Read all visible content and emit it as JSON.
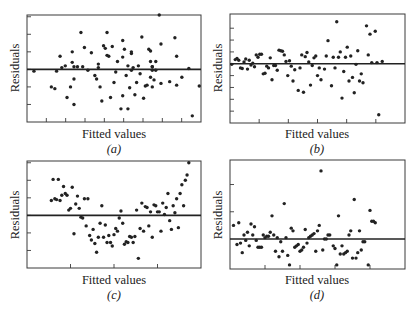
{
  "chart_data": [
    {
      "type": "scatter",
      "panel": "a",
      "caption": "(a)",
      "xlabel": "Fitted values",
      "ylabel": "Residuals",
      "ylim": [
        -3.0,
        3.1
      ],
      "xlim": [
        0,
        1
      ],
      "reference_line": 0,
      "x_ticks": 8,
      "y_ticks": [
        -2,
        -1,
        0,
        1,
        2,
        3
      ],
      "points": [
        [
          0.04,
          -0.1
        ],
        [
          0.14,
          -1.0
        ],
        [
          0.16,
          -1.1
        ],
        [
          0.17,
          -0.1
        ],
        [
          0.19,
          0.75
        ],
        [
          0.2,
          0.1
        ],
        [
          0.22,
          0.2
        ],
        [
          0.23,
          -1.6
        ],
        [
          0.25,
          -1.0
        ],
        [
          0.26,
          1.0
        ],
        [
          0.26,
          0.4
        ],
        [
          0.27,
          -0.55
        ],
        [
          0.27,
          -2.0
        ],
        [
          0.27,
          0.15
        ],
        [
          0.29,
          0.15
        ],
        [
          0.31,
          2.1
        ],
        [
          0.33,
          1.25
        ],
        [
          0.32,
          0.15
        ],
        [
          0.35,
          -0.05
        ],
        [
          0.37,
          0.95
        ],
        [
          0.39,
          -0.35
        ],
        [
          0.4,
          -0.55
        ],
        [
          0.41,
          0.3
        ],
        [
          0.41,
          0.1
        ],
        [
          0.42,
          -1.0
        ],
        [
          0.43,
          -1.8
        ],
        [
          0.44,
          1.35
        ],
        [
          0.45,
          1.2
        ],
        [
          0.46,
          0.8
        ],
        [
          0.46,
          2.1
        ],
        [
          0.47,
          0.75
        ],
        [
          0.48,
          -1.6
        ],
        [
          0.49,
          1.3
        ],
        [
          0.5,
          -0.75
        ],
        [
          0.51,
          -0.15
        ],
        [
          0.52,
          0.45
        ],
        [
          0.54,
          -2.25
        ],
        [
          0.55,
          1.65
        ],
        [
          0.55,
          0.7
        ],
        [
          0.55,
          -1.5
        ],
        [
          0.56,
          1.15
        ],
        [
          0.57,
          -0.35
        ],
        [
          0.58,
          -2.25
        ],
        [
          0.58,
          0.2
        ],
        [
          0.59,
          -1.05
        ],
        [
          0.6,
          -0.05
        ],
        [
          0.6,
          0.9
        ],
        [
          0.6,
          1.0
        ],
        [
          0.61,
          0.1
        ],
        [
          0.62,
          -1.45
        ],
        [
          0.63,
          -0.75
        ],
        [
          0.64,
          0.2
        ],
        [
          0.65,
          -0.25
        ],
        [
          0.66,
          1.85
        ],
        [
          0.67,
          -1.65
        ],
        [
          0.68,
          -0.95
        ],
        [
          0.69,
          -0.9
        ],
        [
          0.7,
          1.15
        ],
        [
          0.71,
          1.05
        ],
        [
          0.71,
          0.45
        ],
        [
          0.71,
          -0.45
        ],
        [
          0.72,
          0.15
        ],
        [
          0.72,
          -0.05
        ],
        [
          0.72,
          0.15
        ],
        [
          0.72,
          -1.0
        ],
        [
          0.73,
          -0.6
        ],
        [
          0.74,
          0.45
        ],
        [
          0.74,
          -0.05
        ],
        [
          0.76,
          3.1
        ],
        [
          0.77,
          1.45
        ],
        [
          0.77,
          -0.8
        ],
        [
          0.82,
          -0.7
        ],
        [
          0.85,
          1.8
        ],
        [
          0.86,
          -0.9
        ],
        [
          0.86,
          0.75
        ],
        [
          0.89,
          -0.45
        ],
        [
          0.93,
          0.05
        ],
        [
          0.95,
          -2.65
        ],
        [
          0.99,
          -0.95
        ]
      ]
    },
    {
      "type": "scatter",
      "panel": "b",
      "caption": "(b)",
      "xlabel": "Fitted values",
      "ylabel": "Residuals",
      "ylim": [
        -5.0,
        4.2
      ],
      "xlim": [
        0,
        1
      ],
      "reference_line": 0,
      "x_ticks": 5,
      "y_ticks": [
        -4,
        -3,
        -2,
        -1,
        0,
        1,
        2,
        3
      ],
      "points": [
        [
          0.01,
          -0.05
        ],
        [
          0.03,
          0.35
        ],
        [
          0.04,
          0.45
        ],
        [
          0.05,
          0.3
        ],
        [
          0.06,
          -0.35
        ],
        [
          0.07,
          -0.4
        ],
        [
          0.08,
          0.15
        ],
        [
          0.09,
          0.4
        ],
        [
          0.1,
          -0.45
        ],
        [
          0.11,
          0.3
        ],
        [
          0.12,
          -0.1
        ],
        [
          0.13,
          0.05
        ],
        [
          0.14,
          -0.25
        ],
        [
          0.15,
          0.75
        ],
        [
          0.16,
          0.55
        ],
        [
          0.17,
          0.8
        ],
        [
          0.18,
          0.8
        ],
        [
          0.19,
          -0.85
        ],
        [
          0.2,
          -0.8
        ],
        [
          0.21,
          -0.2
        ],
        [
          0.22,
          -0.35
        ],
        [
          0.23,
          0.5
        ],
        [
          0.24,
          -1.35
        ],
        [
          0.25,
          -0.15
        ],
        [
          0.26,
          -0.15
        ],
        [
          0.27,
          -0.55
        ],
        [
          0.28,
          1.15
        ],
        [
          0.29,
          1.1
        ],
        [
          0.3,
          1.05
        ],
        [
          0.31,
          0.75
        ],
        [
          0.32,
          0.2
        ],
        [
          0.33,
          -1.0
        ],
        [
          0.34,
          0.25
        ],
        [
          0.35,
          -0.2
        ],
        [
          0.36,
          -1.45
        ],
        [
          0.37,
          -0.5
        ],
        [
          0.39,
          -2.25
        ],
        [
          0.4,
          -0.35
        ],
        [
          0.41,
          0.75
        ],
        [
          0.42,
          -2.4
        ],
        [
          0.43,
          0.6
        ],
        [
          0.44,
          0.95
        ],
        [
          0.45,
          0.15
        ],
        [
          0.46,
          -1.8
        ],
        [
          0.47,
          -0.15
        ],
        [
          0.48,
          0.5
        ],
        [
          0.49,
          0.65
        ],
        [
          0.5,
          -1.0
        ],
        [
          0.51,
          -0.35
        ],
        [
          0.52,
          -1.35
        ],
        [
          0.54,
          -0.45
        ],
        [
          0.55,
          0.65
        ],
        [
          0.56,
          1.95
        ],
        [
          0.58,
          -1.85
        ],
        [
          0.59,
          0.55
        ],
        [
          0.6,
          -0.35
        ],
        [
          0.61,
          3.55
        ],
        [
          0.62,
          0.55
        ],
        [
          0.63,
          1.0
        ],
        [
          0.64,
          -2.9
        ],
        [
          0.65,
          -0.65
        ],
        [
          0.66,
          0.55
        ],
        [
          0.67,
          1.4
        ],
        [
          0.68,
          -1.45
        ],
        [
          0.69,
          0.65
        ],
        [
          0.7,
          -1.15
        ],
        [
          0.71,
          -2.45
        ],
        [
          0.72,
          -0.05
        ],
        [
          0.73,
          1.1
        ],
        [
          0.74,
          -1.45
        ],
        [
          0.75,
          -0.85
        ],
        [
          0.76,
          -1.6
        ],
        [
          0.78,
          3.2
        ],
        [
          0.79,
          0.75
        ],
        [
          0.8,
          2.5
        ],
        [
          0.81,
          0.1
        ],
        [
          0.83,
          2.75
        ],
        [
          0.84,
          0.1
        ],
        [
          0.85,
          -4.3
        ],
        [
          0.87,
          0.2
        ]
      ]
    },
    {
      "type": "scatter",
      "panel": "c",
      "caption": "(c)",
      "xlabel": "Fitted values",
      "ylabel": "Residuals",
      "ylim": [
        -3.0,
        3.1
      ],
      "xlim": [
        0,
        1
      ],
      "reference_line": 0,
      "x_ticks": 3,
      "y_ticks": [
        -2,
        -1,
        0,
        1,
        2,
        3
      ],
      "points": [
        [
          0.14,
          0.85
        ],
        [
          0.15,
          2.05
        ],
        [
          0.16,
          0.95
        ],
        [
          0.17,
          0.9
        ],
        [
          0.18,
          2.05
        ],
        [
          0.19,
          0.85
        ],
        [
          0.2,
          1.15
        ],
        [
          0.21,
          1.65
        ],
        [
          0.22,
          1.25
        ],
        [
          0.23,
          1.15
        ],
        [
          0.24,
          0.3
        ],
        [
          0.25,
          0.4
        ],
        [
          0.26,
          1.6
        ],
        [
          0.27,
          -1.05
        ],
        [
          0.28,
          0.65
        ],
        [
          0.29,
          1.1
        ],
        [
          0.3,
          0.4
        ],
        [
          0.31,
          -0.1
        ],
        [
          0.32,
          -0.15
        ],
        [
          0.33,
          0.95
        ],
        [
          0.34,
          -0.6
        ],
        [
          0.35,
          0.95
        ],
        [
          0.36,
          -1.15
        ],
        [
          0.37,
          -1.4
        ],
        [
          0.38,
          -0.8
        ],
        [
          0.39,
          -1.6
        ],
        [
          0.4,
          -2.1
        ],
        [
          0.41,
          -1.25
        ],
        [
          0.42,
          -0.45
        ],
        [
          0.43,
          0.55
        ],
        [
          0.44,
          -1.25
        ],
        [
          0.45,
          -0.55
        ],
        [
          0.46,
          -1.55
        ],
        [
          0.47,
          -1.15
        ],
        [
          0.48,
          -1.55
        ],
        [
          0.49,
          -1.75
        ],
        [
          0.5,
          -1.1
        ],
        [
          0.51,
          -0.75
        ],
        [
          0.52,
          -0.9
        ],
        [
          0.53,
          -0.15
        ],
        [
          0.54,
          0.25
        ],
        [
          0.55,
          -0.45
        ],
        [
          0.56,
          -1.65
        ],
        [
          0.57,
          -1.5
        ],
        [
          0.58,
          -1.55
        ],
        [
          0.59,
          -1.2
        ],
        [
          0.6,
          -1.25
        ],
        [
          0.61,
          -1.55
        ],
        [
          0.62,
          -1.2
        ],
        [
          0.63,
          0.3
        ],
        [
          0.64,
          -2.45
        ],
        [
          0.65,
          -0.75
        ],
        [
          0.66,
          0.7
        ],
        [
          0.67,
          -0.9
        ],
        [
          0.68,
          0.5
        ],
        [
          0.69,
          0.45
        ],
        [
          0.7,
          -0.6
        ],
        [
          0.71,
          0.2
        ],
        [
          0.72,
          -1.25
        ],
        [
          0.73,
          0.6
        ],
        [
          0.74,
          0.55
        ],
        [
          0.75,
          0.2
        ],
        [
          0.76,
          0.2
        ],
        [
          0.77,
          -0.9
        ],
        [
          0.78,
          0.7
        ],
        [
          0.79,
          0.05
        ],
        [
          0.8,
          0.45
        ],
        [
          0.81,
          1.25
        ],
        [
          0.82,
          -0.3
        ],
        [
          0.83,
          -0.8
        ],
        [
          0.84,
          0.55
        ],
        [
          0.85,
          0.15
        ],
        [
          0.86,
          0.95
        ],
        [
          0.87,
          -0.7
        ],
        [
          0.88,
          1.25
        ],
        [
          0.89,
          1.75
        ],
        [
          0.9,
          0.55
        ],
        [
          0.91,
          2.0
        ],
        [
          0.92,
          2.3
        ],
        [
          0.93,
          3.0
        ]
      ]
    },
    {
      "type": "scatter",
      "panel": "d",
      "caption": "(d)",
      "xlabel": "Fitted values",
      "ylabel": "Residuals",
      "ylim": [
        -1.1,
        2.9
      ],
      "xlim": [
        0,
        1
      ],
      "reference_line": 0,
      "x_ticks": 4,
      "y_ticks": [
        1,
        2
      ],
      "points": [
        [
          0.02,
          0.5
        ],
        [
          0.04,
          -0.2
        ],
        [
          0.05,
          0.6
        ],
        [
          0.06,
          -0.15
        ],
        [
          0.07,
          -0.5
        ],
        [
          0.08,
          0.15
        ],
        [
          0.09,
          -0.05
        ],
        [
          0.1,
          0.25
        ],
        [
          0.11,
          -0.25
        ],
        [
          0.12,
          0.55
        ],
        [
          0.13,
          0.15
        ],
        [
          0.14,
          0.45
        ],
        [
          0.15,
          -0.05
        ],
        [
          0.16,
          -0.3
        ],
        [
          0.17,
          -0.3
        ],
        [
          0.18,
          -0.3
        ],
        [
          0.19,
          0.15
        ],
        [
          0.2,
          0.05
        ],
        [
          0.21,
          0.1
        ],
        [
          0.22,
          0.1
        ],
        [
          0.23,
          0.25
        ],
        [
          0.24,
          0.85
        ],
        [
          0.25,
          0.15
        ],
        [
          0.26,
          -0.45
        ],
        [
          0.27,
          0.05
        ],
        [
          0.28,
          -0.65
        ],
        [
          0.29,
          -0.1
        ],
        [
          0.3,
          -0.45
        ],
        [
          0.31,
          1.3
        ],
        [
          0.32,
          0.05
        ],
        [
          0.33,
          -0.6
        ],
        [
          0.34,
          -0.95
        ],
        [
          0.35,
          0.4
        ],
        [
          0.36,
          0.3
        ],
        [
          0.37,
          -0.3
        ],
        [
          0.38,
          -0.25
        ],
        [
          0.39,
          -0.2
        ],
        [
          0.4,
          -0.45
        ],
        [
          0.41,
          -0.4
        ],
        [
          0.42,
          -0.3
        ],
        [
          0.43,
          0.35
        ],
        [
          0.44,
          -0.15
        ],
        [
          0.45,
          0.05
        ],
        [
          0.46,
          0.1
        ],
        [
          0.47,
          0.15
        ],
        [
          0.48,
          0.2
        ],
        [
          0.49,
          -0.45
        ],
        [
          0.5,
          0.3
        ],
        [
          0.51,
          0.5
        ],
        [
          0.52,
          2.5
        ],
        [
          0.53,
          -0.4
        ],
        [
          0.54,
          0.0
        ],
        [
          0.55,
          0.0
        ],
        [
          0.56,
          0.15
        ],
        [
          0.57,
          0.15
        ],
        [
          0.59,
          -0.25
        ],
        [
          0.6,
          -0.35
        ],
        [
          0.61,
          -0.95
        ],
        [
          0.62,
          0.85
        ],
        [
          0.63,
          -0.55
        ],
        [
          0.64,
          -0.25
        ],
        [
          0.65,
          -0.55
        ],
        [
          0.66,
          -0.5
        ],
        [
          0.67,
          -0.45
        ],
        [
          0.68,
          0.15
        ],
        [
          0.69,
          0.3
        ],
        [
          0.7,
          -0.7
        ],
        [
          0.71,
          1.45
        ],
        [
          0.72,
          -0.7
        ],
        [
          0.73,
          -0.5
        ],
        [
          0.74,
          0.3
        ],
        [
          0.75,
          -0.4
        ],
        [
          0.76,
          -0.1
        ],
        [
          0.77,
          -0.1
        ],
        [
          0.79,
          -0.95
        ],
        [
          0.8,
          1.05
        ],
        [
          0.81,
          0.65
        ],
        [
          0.82,
          0.65
        ],
        [
          0.83,
          0.6
        ]
      ]
    }
  ]
}
